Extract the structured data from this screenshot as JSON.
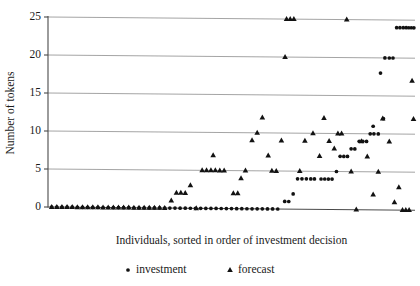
{
  "chart_data": {
    "type": "scatter",
    "title": "",
    "xlabel": "Individuals, sorted in order of investment decision",
    "ylabel": "Number of tokens",
    "ylim": [
      0,
      25
    ],
    "yticks": [
      0,
      5,
      10,
      15,
      20,
      25
    ],
    "ytick_labels": [
      "0",
      "5",
      "10",
      "15",
      "20",
      "25"
    ],
    "xlim": [
      0,
      100
    ],
    "xticks": [],
    "xtick_labels": [],
    "grid": "horizontal",
    "legend_position": "below-axis",
    "series": [
      {
        "name": "investment",
        "marker": "circle",
        "color": "#121212",
        "points": [
          [
            1.0,
            0
          ],
          [
            2.4,
            0
          ],
          [
            3.8,
            0
          ],
          [
            5.2,
            0
          ],
          [
            6.6,
            0
          ],
          [
            8.0,
            0
          ],
          [
            9.4,
            0
          ],
          [
            10.8,
            0
          ],
          [
            12.2,
            0
          ],
          [
            13.6,
            0
          ],
          [
            15.0,
            0
          ],
          [
            16.4,
            0
          ],
          [
            17.8,
            0
          ],
          [
            19.2,
            0
          ],
          [
            20.6,
            0
          ],
          [
            22.0,
            0
          ],
          [
            23.4,
            0
          ],
          [
            24.8,
            0
          ],
          [
            26.2,
            0
          ],
          [
            27.6,
            0
          ],
          [
            29.0,
            0
          ],
          [
            30.4,
            0
          ],
          [
            31.8,
            0
          ],
          [
            33.2,
            0
          ],
          [
            34.6,
            0
          ],
          [
            36.0,
            0
          ],
          [
            37.4,
            0
          ],
          [
            38.8,
            0
          ],
          [
            40.2,
            0
          ],
          [
            41.6,
            0
          ],
          [
            43.0,
            0
          ],
          [
            44.4,
            0
          ],
          [
            45.8,
            0
          ],
          [
            47.2,
            0
          ],
          [
            48.6,
            0
          ],
          [
            50.0,
            0
          ],
          [
            51.4,
            0
          ],
          [
            52.8,
            0
          ],
          [
            54.2,
            0
          ],
          [
            55.6,
            0
          ],
          [
            57.0,
            0
          ],
          [
            58.4,
            0
          ],
          [
            59.8,
            0
          ],
          [
            61.2,
            0
          ],
          [
            62.6,
            0
          ],
          [
            64.5,
            1
          ],
          [
            65.6,
            1
          ],
          [
            66.8,
            2
          ],
          [
            68.0,
            4
          ],
          [
            69.2,
            4
          ],
          [
            70.4,
            4
          ],
          [
            71.6,
            4
          ],
          [
            72.6,
            4
          ],
          [
            74.4,
            4
          ],
          [
            75.4,
            4
          ],
          [
            76.4,
            4
          ],
          [
            77.4,
            4
          ],
          [
            78.6,
            5
          ],
          [
            79.6,
            7
          ],
          [
            80.6,
            7
          ],
          [
            81.6,
            7
          ],
          [
            82.6,
            8
          ],
          [
            83.6,
            8
          ],
          [
            84.8,
            9
          ],
          [
            85.8,
            9
          ],
          [
            86.8,
            9
          ],
          [
            87.8,
            10
          ],
          [
            88.8,
            10
          ],
          [
            90.0,
            10
          ],
          [
            88.6,
            11
          ],
          [
            91.4,
            12
          ],
          [
            90.6,
            18
          ],
          [
            91.8,
            20
          ],
          [
            93.0,
            20
          ],
          [
            94.0,
            20
          ],
          [
            95.0,
            24
          ],
          [
            95.9,
            24
          ],
          [
            96.8,
            24
          ],
          [
            97.6,
            24
          ],
          [
            98.3,
            24
          ],
          [
            99.0,
            24
          ],
          [
            99.7,
            24
          ]
        ]
      },
      {
        "name": "forecast",
        "marker": "triangle",
        "color": "#121212",
        "points": [
          [
            1.0,
            0
          ],
          [
            2.4,
            0
          ],
          [
            3.8,
            0
          ],
          [
            5.2,
            0
          ],
          [
            6.6,
            0
          ],
          [
            8.0,
            0
          ],
          [
            9.4,
            0
          ],
          [
            10.8,
            0
          ],
          [
            12.2,
            0
          ],
          [
            13.6,
            0
          ],
          [
            15.0,
            0
          ],
          [
            16.4,
            0
          ],
          [
            17.8,
            0
          ],
          [
            19.2,
            0
          ],
          [
            20.6,
            0
          ],
          [
            22.0,
            0
          ],
          [
            23.4,
            0
          ],
          [
            24.8,
            0
          ],
          [
            26.2,
            0
          ],
          [
            27.6,
            0
          ],
          [
            29.0,
            0
          ],
          [
            30.4,
            0
          ],
          [
            31.8,
            0
          ],
          [
            33.6,
            1
          ],
          [
            35.0,
            2
          ],
          [
            36.2,
            2
          ],
          [
            37.4,
            2
          ],
          [
            38.8,
            3
          ],
          [
            40.4,
            0
          ],
          [
            42.0,
            5
          ],
          [
            43.2,
            5
          ],
          [
            44.4,
            5
          ],
          [
            45.6,
            5
          ],
          [
            46.8,
            5
          ],
          [
            48.0,
            5
          ],
          [
            45.0,
            7
          ],
          [
            50.5,
            2
          ],
          [
            51.7,
            2
          ],
          [
            52.6,
            4
          ],
          [
            53.8,
            5
          ],
          [
            55.6,
            9
          ],
          [
            57.0,
            10
          ],
          [
            58.4,
            12
          ],
          [
            61.0,
            5
          ],
          [
            62.2,
            5
          ],
          [
            60.0,
            7
          ],
          [
            63.6,
            9
          ],
          [
            65.0,
            25
          ],
          [
            66.0,
            25
          ],
          [
            67.0,
            25
          ],
          [
            64.6,
            20
          ],
          [
            68.6,
            5
          ],
          [
            70.0,
            9
          ],
          [
            72.2,
            10
          ],
          [
            74.0,
            7
          ],
          [
            75.2,
            12
          ],
          [
            76.6,
            9
          ],
          [
            78.0,
            8
          ],
          [
            79.0,
            10
          ],
          [
            80.0,
            10
          ],
          [
            81.4,
            25
          ],
          [
            82.6,
            5
          ],
          [
            84.0,
            0
          ],
          [
            85.4,
            9
          ],
          [
            87.0,
            7
          ],
          [
            88.6,
            2
          ],
          [
            90.0,
            5
          ],
          [
            91.2,
            12
          ],
          [
            93.0,
            9
          ],
          [
            94.4,
            1
          ],
          [
            95.6,
            3
          ],
          [
            96.6,
            0
          ],
          [
            97.5,
            0
          ],
          [
            98.4,
            0
          ],
          [
            99.2,
            17
          ],
          [
            99.6,
            12
          ]
        ]
      }
    ],
    "legend": [
      {
        "label": "investment",
        "marker": "circle",
        "color": "#121212"
      },
      {
        "label": "forecast",
        "marker": "triangle",
        "color": "#121212"
      }
    ]
  },
  "figure": {
    "background": "#ffffff",
    "axis_color": "#4a4a4a",
    "grid_color": "#9a9a9a",
    "marker_color": "#121212"
  }
}
